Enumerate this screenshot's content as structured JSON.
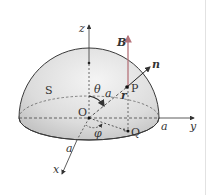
{
  "figure": {
    "type": "hemisphere-surface-diagram",
    "labels": {
      "z_axis": "z",
      "y_axis": "y",
      "x_axis": "x",
      "field": "B",
      "normal": "n",
      "surface": "S",
      "origin": "O",
      "point_p": "P",
      "point_q": "Q",
      "theta": "θ",
      "phi": "φ",
      "radius_op": "a",
      "radius_y": "a",
      "radius_x": "a",
      "position_vector": "r"
    },
    "colors": {
      "field_arrow": "#b5737a",
      "outline": "#3a3a3a",
      "shade_light": "#f2f2f2",
      "shade_dark": "#bdbdbd"
    }
  }
}
